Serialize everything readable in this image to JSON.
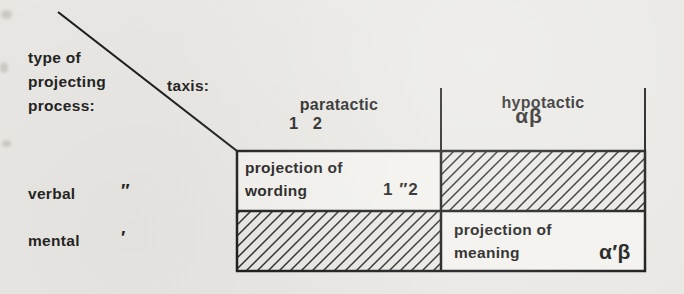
{
  "figure": {
    "background_color": "#e9e8e4",
    "ink_color": "#1f1f1f",
    "hatch_color": "#2b2b2b"
  },
  "corner": {
    "row_axis_label": "type of\nprojecting\nprocess:",
    "column_axis_label": "taxis:"
  },
  "columns": [
    {
      "label": "paratactic",
      "notation": "1 2"
    },
    {
      "label": "hypotactic",
      "notation": "αβ"
    }
  ],
  "rows": [
    {
      "label": "verbal",
      "mark": "″"
    },
    {
      "label": "mental",
      "mark": "′"
    }
  ],
  "cells": {
    "verbal_paratactic": {
      "label": "projection of\nwording",
      "notation": "1 ″2",
      "hatched": false
    },
    "verbal_hypotactic": {
      "label": "",
      "notation": "",
      "hatched": true
    },
    "mental_paratactic": {
      "label": "",
      "notation": "",
      "hatched": true
    },
    "mental_hypotactic": {
      "label": "projection of\nmeaning",
      "notation": "α′β",
      "hatched": false
    }
  }
}
